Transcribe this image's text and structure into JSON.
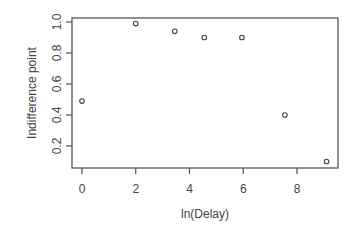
{
  "chart_data": {
    "type": "scatter",
    "title": "",
    "xlabel": "ln(Delay)",
    "ylabel": "Indifference point",
    "x": [
      0,
      2.0,
      3.45,
      4.55,
      5.95,
      7.55,
      9.1
    ],
    "y": [
      0.49,
      0.99,
      0.94,
      0.9,
      0.9,
      0.4,
      0.1
    ],
    "xticks": [
      0,
      2,
      4,
      6,
      8
    ],
    "xtick_labels": [
      "0",
      "2",
      "4",
      "6",
      "8"
    ],
    "yticks": [
      0.2,
      0.4,
      0.6,
      0.8,
      1.0
    ],
    "ytick_labels": [
      "0.2",
      "0.4",
      "0.6",
      "0.8",
      "1.0"
    ],
    "xlim": [
      -0.37,
      9.5
    ],
    "ylim": [
      0.07,
      1.03
    ],
    "grid": false,
    "legend": null,
    "marker": "open-circle"
  }
}
